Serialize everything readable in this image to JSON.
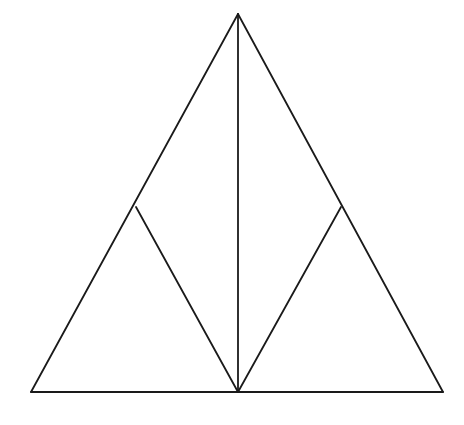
{
  "figure": {
    "background_color": "#ffffff",
    "stroke_color": "#1a1a1a",
    "stroke_width": 1.8,
    "canvas": {
      "width": 464,
      "height": 425
    },
    "points": {
      "apex": {
        "name": "apex",
        "x": 238,
        "y": 14
      },
      "bottom_left": {
        "name": "bottom-left",
        "x": 31,
        "y": 392
      },
      "bottom_right": {
        "name": "bottom-right",
        "x": 443,
        "y": 392
      },
      "bottom_center": {
        "name": "bottom-center",
        "x": 238,
        "y": 392
      },
      "left_branch": {
        "name": "left-branch",
        "x": 136,
        "y": 207
      },
      "right_branch": {
        "name": "right-branch",
        "x": 341,
        "y": 207
      }
    },
    "segments": [
      {
        "id": "outer-left-edge",
        "label": "Left outer edge",
        "from": "apex",
        "to": "bottom_left",
        "d": "M 238 14 L 31 392"
      },
      {
        "id": "outer-right-edge",
        "label": "Right outer edge",
        "from": "apex",
        "to": "bottom_right",
        "d": "M 238 14 L 443 392"
      },
      {
        "id": "base-edge",
        "label": "Base",
        "from": "bottom_left",
        "to": "bottom_right",
        "d": "M 31 392 L 443 392"
      },
      {
        "id": "vertical-median",
        "label": "Vertical median",
        "from": "apex",
        "to": "bottom_center",
        "d": "M 238 14 L 238 392"
      },
      {
        "id": "left-inner-diagonal",
        "label": "Left inner diagonal",
        "from": "left_branch",
        "to": "bottom_center",
        "d": "M 136 207 L 238 392"
      },
      {
        "id": "right-inner-diagonal",
        "label": "Right inner diagonal",
        "from": "right_branch",
        "to": "bottom_center",
        "d": "M 341 207 L 238 392"
      }
    ]
  }
}
